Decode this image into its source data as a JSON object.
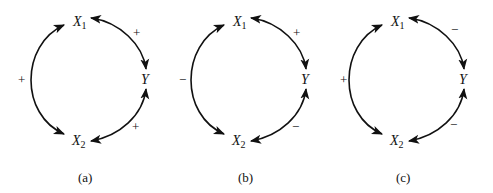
{
  "figure": {
    "panels": [
      {
        "caption": "(a)",
        "nodes": {
          "x1": "X",
          "x1_sub": "1",
          "y": "Y",
          "x2": "X",
          "x2_sub": "2"
        },
        "edges": {
          "x1_x2": "+",
          "x1_y": "+",
          "x2_y": "+"
        }
      },
      {
        "caption": "(b)",
        "nodes": {
          "x1": "X",
          "x1_sub": "1",
          "y": "Y",
          "x2": "X",
          "x2_sub": "2"
        },
        "edges": {
          "x1_x2": "−",
          "x1_y": "+",
          "x2_y": "−"
        }
      },
      {
        "caption": "(c)",
        "nodes": {
          "x1": "X",
          "x1_sub": "1",
          "y": "Y",
          "x2": "X",
          "x2_sub": "2"
        },
        "edges": {
          "x1_x2": "+",
          "x1_y": "−",
          "x2_y": "−"
        }
      }
    ],
    "colors": {
      "ink": "#111111",
      "background": "#ffffff"
    }
  }
}
